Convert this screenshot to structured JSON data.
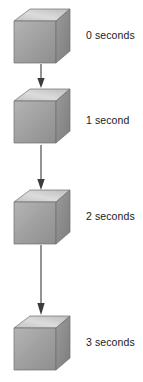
{
  "figure": {
    "background_color": "#ffffff",
    "ink_color": "#3c3c3c",
    "label_color": "#1a1a1a"
  },
  "cube": {
    "top_face_color": "#d8d8d8",
    "left_face_color": "#a9a9a9",
    "right_face_color": "#8c8c8c",
    "edge_color": "#6e6e6e"
  },
  "stages": [
    {
      "index": 0,
      "label": "0 seconds",
      "seconds": 0,
      "cube_top_px": 8,
      "label_top_px": 29
    },
    {
      "index": 1,
      "label": "1 second",
      "seconds": 1,
      "cube_top_px": 88,
      "label_top_px": 114
    },
    {
      "index": 2,
      "label": "2 seconds",
      "seconds": 2,
      "cube_top_px": 189,
      "label_top_px": 210
    },
    {
      "index": 3,
      "label": "3 seconds",
      "seconds": 3,
      "cube_top_px": 315,
      "label_top_px": 336
    }
  ],
  "arrows": [
    {
      "index": 0,
      "from_stage": 0,
      "to_stage": 1,
      "top_px": 64,
      "height_px": 24,
      "direction": "down"
    },
    {
      "index": 1,
      "from_stage": 1,
      "to_stage": 2,
      "top_px": 145,
      "height_px": 45,
      "direction": "down"
    },
    {
      "index": 2,
      "from_stage": 2,
      "to_stage": 3,
      "top_px": 245,
      "height_px": 70,
      "direction": "down"
    }
  ]
}
